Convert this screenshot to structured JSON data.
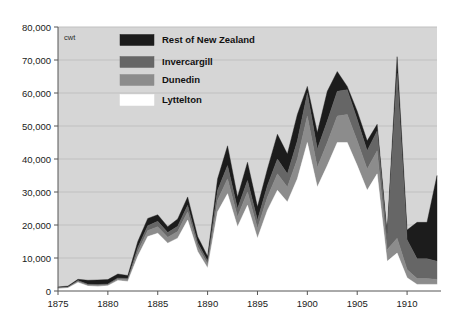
{
  "chart_data": {
    "type": "area",
    "stacked": true,
    "title": "",
    "subtitle": "",
    "xlabel": "",
    "ylabel": "",
    "unit_label": "cwt",
    "grid": true,
    "legend_position": "top-center",
    "xlim": [
      1875,
      1913
    ],
    "ylim": [
      0,
      80000
    ],
    "x_ticks": [
      1875,
      1880,
      1885,
      1890,
      1895,
      1900,
      1905,
      1910
    ],
    "x_tick_labels": [
      "1875",
      "1880",
      "1885",
      "1890",
      "1895",
      "1900",
      "1905",
      "1910"
    ],
    "y_ticks": [
      0,
      10000,
      20000,
      30000,
      40000,
      50000,
      60000,
      70000,
      80000
    ],
    "y_tick_labels": [
      "0",
      "10,000",
      "20,000",
      "30,000",
      "40,000",
      "50,000",
      "60,000",
      "70,000",
      "80,000"
    ],
    "x": [
      1875,
      1876,
      1877,
      1878,
      1879,
      1880,
      1881,
      1882,
      1883,
      1884,
      1885,
      1886,
      1887,
      1888,
      1889,
      1890,
      1891,
      1892,
      1893,
      1894,
      1895,
      1896,
      1897,
      1898,
      1899,
      1900,
      1901,
      1902,
      1903,
      1904,
      1905,
      1906,
      1907,
      1908,
      1909,
      1910,
      1911,
      1912,
      1913
    ],
    "series": [
      {
        "name": "Lyttelton",
        "color": "#ffffff",
        "stack_order": 1,
        "values": [
          700,
          900,
          2600,
          1500,
          1400,
          1600,
          3200,
          2900,
          10500,
          16500,
          17500,
          14500,
          16000,
          21500,
          12000,
          7000,
          24000,
          29500,
          19500,
          26000,
          16000,
          24500,
          30500,
          27000,
          34000,
          45000,
          31500,
          38000,
          45000,
          45000,
          38000,
          30500,
          35500,
          9000,
          11500,
          4000,
          2000,
          2000,
          2000
        ]
      },
      {
        "name": "Dunedin",
        "color": "#8c8c8c",
        "stack_order": 2,
        "values": [
          200,
          200,
          300,
          300,
          300,
          300,
          400,
          500,
          1500,
          1800,
          2000,
          1800,
          2000,
          2500,
          1500,
          1200,
          3500,
          4500,
          3000,
          4000,
          3000,
          4000,
          5000,
          4500,
          6000,
          8000,
          6000,
          7000,
          8000,
          8500,
          7500,
          6500,
          7000,
          3500,
          4500,
          2500,
          1800,
          1800,
          1500
        ]
      },
      {
        "name": "Invercargill",
        "color": "#666666",
        "stack_order": 3,
        "values": [
          150,
          150,
          250,
          250,
          250,
          250,
          350,
          400,
          1200,
          1500,
          1600,
          1400,
          1600,
          2000,
          1200,
          900,
          3000,
          4000,
          2500,
          3500,
          2500,
          3500,
          4500,
          4000,
          5500,
          7000,
          5500,
          6500,
          7500,
          7500,
          6500,
          5500,
          6000,
          3500,
          50000,
          9000,
          6000,
          6000,
          5500
        ]
      },
      {
        "name": "Rest of New Zealand",
        "color": "#1c1c1c",
        "stack_order": 4,
        "values": [
          200,
          250,
          400,
          1200,
          1400,
          1300,
          1200,
          900,
          1800,
          2200,
          2000,
          1800,
          2200,
          2500,
          1800,
          1400,
          3500,
          6000,
          3500,
          5500,
          4000,
          5000,
          7500,
          6000,
          8000,
          2000,
          5000,
          9000,
          6000,
          1000,
          2500,
          3000,
          2000,
          1500,
          5000,
          3000,
          11000,
          11000,
          26000
        ]
      }
    ],
    "totals": [
      1250,
      1500,
      3550,
      3250,
      3350,
      3450,
      5150,
      4700,
      15000,
      22000,
      23100,
      19500,
      21800,
      28500,
      16500,
      10500,
      34000,
      44000,
      28500,
      39000,
      25500,
      37000,
      47500,
      41500,
      53500,
      62000,
      48000,
      60500,
      66500,
      62000,
      54500,
      45500,
      50500,
      17500,
      71000,
      18500,
      20800,
      20800,
      35000
    ]
  },
  "legend": {
    "entries": [
      {
        "label": "Rest of New Zealand",
        "color": "#1c1c1c"
      },
      {
        "label": "Invercargill",
        "color": "#666666"
      },
      {
        "label": "Dunedin",
        "color": "#8c8c8c"
      },
      {
        "label": "Lyttelton",
        "color": "#ffffff"
      }
    ]
  },
  "style": {
    "plot_background": "#d6d6d6",
    "grid_color": "#c0c0c0",
    "axis_color": "#555555",
    "page_background": "#ffffff",
    "text_color": "#1a1a1a"
  }
}
